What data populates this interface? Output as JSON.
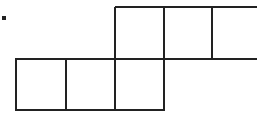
{
  "diagram": {
    "stroke_color": "#222222",
    "background": "#ffffff",
    "bottom_row": {
      "cells": 3
    },
    "top_row": {
      "cells": 3,
      "open_right_edge": true
    },
    "marker": {
      "shape": "dot"
    }
  }
}
